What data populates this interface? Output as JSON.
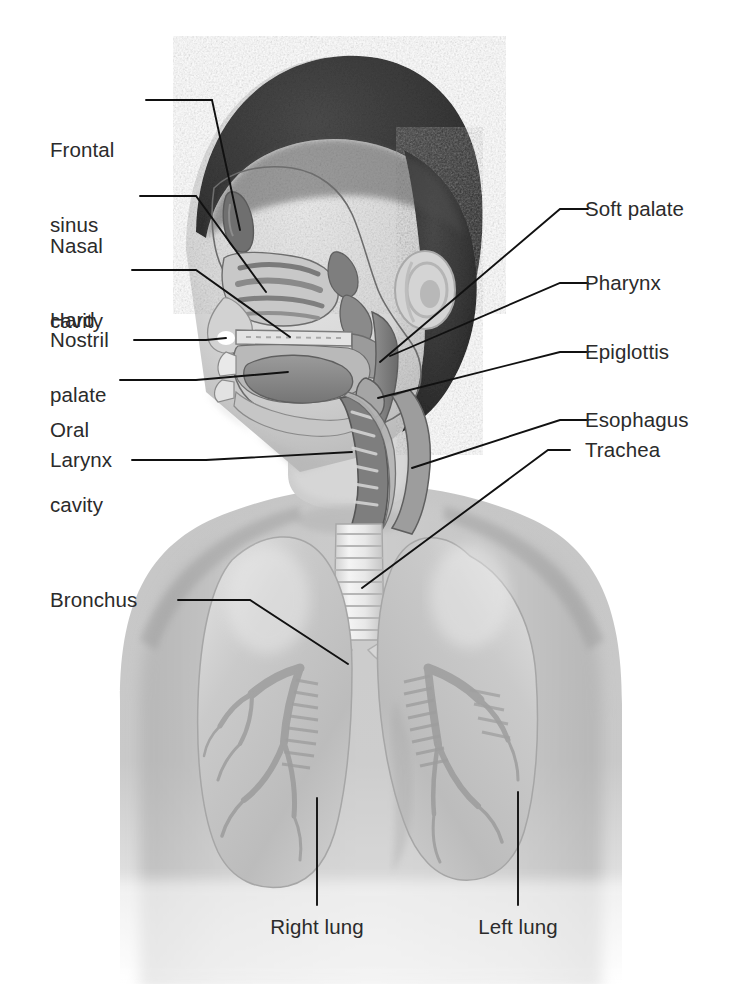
{
  "figure": {
    "type": "anatomical-illustration",
    "view": "anterior torso with midsagittal head section",
    "background_color": "#ffffff",
    "line_color": "#1a1a1a",
    "text_color": "#2b2b2b",
    "skin_tone": "#c9c9c9",
    "hair_color": "#3a3a3a",
    "tissue_color": "#8f8f8f",
    "lung_color": "#bdbdbd"
  },
  "labels": {
    "left": [
      {
        "text": "Frontal\nsinus",
        "line1": "Frontal",
        "line2": "sinus"
      },
      {
        "text": "Nasal\ncavity",
        "line1": "Nasal",
        "line2": "cavity"
      },
      {
        "text": "Hard\npalate",
        "line1": "Hard",
        "line2": "palate"
      },
      {
        "text": "Nostril",
        "line1": "Nostril",
        "line2": ""
      },
      {
        "text": "Oral\ncavity",
        "line1": "Oral",
        "line2": "cavity"
      },
      {
        "text": "Larynx",
        "line1": "Larynx",
        "line2": ""
      },
      {
        "text": "Bronchus",
        "line1": "Bronchus",
        "line2": ""
      }
    ],
    "right": [
      {
        "text": "Soft palate"
      },
      {
        "text": "Pharynx"
      },
      {
        "text": "Epiglottis"
      },
      {
        "text": "Esophagus"
      },
      {
        "text": "Trachea"
      }
    ],
    "bottom": [
      {
        "text": "Right lung"
      },
      {
        "text": "Left lung"
      }
    ]
  },
  "structures": [
    "frontal sinus",
    "nasal cavity",
    "hard palate",
    "nostril",
    "oral cavity",
    "larynx",
    "soft palate",
    "pharynx",
    "epiglottis",
    "esophagus",
    "trachea",
    "bronchus",
    "right lung",
    "left lung"
  ]
}
